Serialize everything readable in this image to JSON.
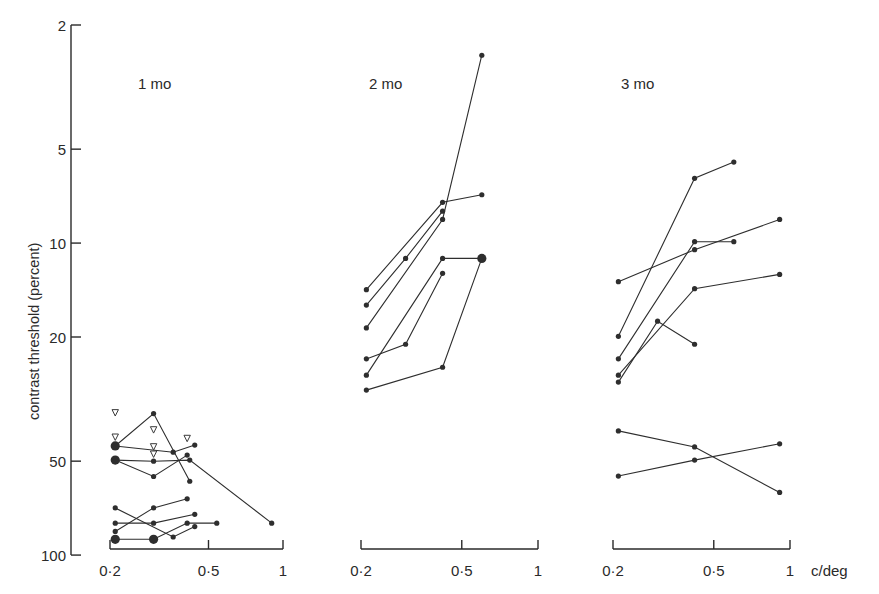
{
  "chart_data": {
    "type": "line",
    "title": "",
    "ylabel": "contrast threshold  (percent)",
    "xlabel": "c/deg",
    "yscale": "log",
    "xscale": "log",
    "ylim": [
      100,
      2
    ],
    "y_inverted": true,
    "y_ticks": [
      2,
      5,
      10,
      20,
      50,
      100
    ],
    "y_tick_labels": [
      "2",
      "5",
      "10",
      "20",
      "50",
      "100"
    ],
    "x_ticks": [
      0.2,
      0.5,
      1
    ],
    "x_tick_labels": [
      "0·2",
      "0·5",
      "1"
    ],
    "grid": false,
    "legend": null,
    "panels": [
      {
        "label": "1 mo",
        "xlim": [
          0.2,
          1
        ],
        "series": [
          {
            "name": "infant-1a",
            "points": [
              [
                0.21,
                44.7
              ],
              [
                0.3,
                35.2
              ],
              [
                0.42,
                58
              ]
            ]
          },
          {
            "name": "infant-1b",
            "points": [
              [
                0.21,
                44.7
              ],
              [
                0.36,
                46.8
              ],
              [
                0.44,
                44.4
              ]
            ]
          },
          {
            "name": "infant-1c",
            "points": [
              [
                0.21,
                49.6
              ],
              [
                0.3,
                50
              ],
              [
                0.42,
                49.6
              ],
              [
                0.9,
                79
              ]
            ]
          },
          {
            "name": "infant-1d",
            "points": [
              [
                0.21,
                49.6
              ],
              [
                0.3,
                56
              ],
              [
                0.41,
                47.8
              ]
            ]
          },
          {
            "name": "infant-1e",
            "points": [
              [
                0.21,
                70.6
              ],
              [
                0.36,
                87.5
              ],
              [
                0.44,
                81
              ]
            ]
          },
          {
            "name": "infant-1f",
            "points": [
              [
                0.21,
                79
              ],
              [
                0.3,
                79
              ],
              [
                0.44,
                74
              ]
            ]
          },
          {
            "name": "infant-1g",
            "points": [
              [
                0.21,
                84
              ],
              [
                0.3,
                70.6
              ],
              [
                0.41,
                66
              ]
            ]
          },
          {
            "name": "infant-1h",
            "points": [
              [
                0.21,
                89
              ],
              [
                0.3,
                89
              ],
              [
                0.41,
                79
              ],
              [
                0.54,
                79
              ]
            ]
          }
        ],
        "large_points": [
          [
            0.21,
            44.7
          ],
          [
            0.21,
            49.6
          ],
          [
            0.21,
            89
          ],
          [
            0.3,
            89
          ]
        ],
        "open_triangles": [
          [
            0.21,
            35
          ],
          [
            0.21,
            41.9
          ],
          [
            0.3,
            39.7
          ],
          [
            0.3,
            45
          ],
          [
            0.3,
            47.5
          ],
          [
            0.41,
            42.3
          ]
        ]
      },
      {
        "label": "2 mo",
        "xlim": [
          0.2,
          1
        ],
        "series": [
          {
            "name": "infant-2a",
            "points": [
              [
                0.21,
                14.1
              ],
              [
                0.42,
                7.4
              ],
              [
                0.6,
                7.0
              ]
            ]
          },
          {
            "name": "infant-2b",
            "points": [
              [
                0.21,
                15.8
              ],
              [
                0.3,
                11.2
              ],
              [
                0.42,
                7.9
              ]
            ]
          },
          {
            "name": "infant-2c",
            "points": [
              [
                0.21,
                18.7
              ],
              [
                0.42,
                8.4
              ],
              [
                0.6,
                2.5
              ]
            ]
          },
          {
            "name": "infant-2d",
            "points": [
              [
                0.21,
                23.5
              ],
              [
                0.3,
                21.1
              ],
              [
                0.42,
                12.5
              ]
            ]
          },
          {
            "name": "infant-2e",
            "points": [
              [
                0.21,
                26.5
              ],
              [
                0.42,
                11.2
              ],
              [
                0.6,
                11.2
              ]
            ]
          },
          {
            "name": "infant-2f",
            "points": [
              [
                0.21,
                29.6
              ],
              [
                0.42,
                25.0
              ],
              [
                0.6,
                11.2
              ]
            ]
          }
        ],
        "large_points": [
          [
            0.6,
            11.2
          ]
        ],
        "open_triangles": []
      },
      {
        "label": "3 mo",
        "xlim": [
          0.2,
          1
        ],
        "series": [
          {
            "name": "infant-3a",
            "points": [
              [
                0.21,
                19.9
              ],
              [
                0.42,
                6.2
              ],
              [
                0.6,
                5.5
              ]
            ]
          },
          {
            "name": "infant-3b",
            "points": [
              [
                0.21,
                13.3
              ],
              [
                0.42,
                10.5
              ],
              [
                0.91,
                8.4
              ]
            ]
          },
          {
            "name": "infant-3c",
            "points": [
              [
                0.21,
                23.5
              ],
              [
                0.42,
                9.9
              ],
              [
                0.6,
                9.9
              ]
            ]
          },
          {
            "name": "infant-3d",
            "points": [
              [
                0.21,
                26.5
              ],
              [
                0.42,
                14.0
              ],
              [
                0.91,
                12.6
              ]
            ]
          },
          {
            "name": "infant-3e",
            "points": [
              [
                0.21,
                27.9
              ],
              [
                0.3,
                17.8
              ],
              [
                0.42,
                21.1
              ]
            ]
          },
          {
            "name": "infant-3f",
            "points": [
              [
                0.21,
                40
              ],
              [
                0.42,
                45
              ],
              [
                0.91,
                63
              ]
            ]
          },
          {
            "name": "infant-3g",
            "points": [
              [
                0.21,
                55.8
              ],
              [
                0.42,
                49.6
              ],
              [
                0.91,
                44
              ]
            ]
          }
        ],
        "large_points": [],
        "open_triangles": []
      }
    ]
  },
  "layout": {
    "y_axis_x": 71,
    "y_px_at_2": 25,
    "y_px_per_decade": 312,
    "x_axis_y": 549,
    "panels_x0": [
      110,
      361,
      613
    ],
    "panels_span": [
      173,
      177,
      177
    ]
  }
}
